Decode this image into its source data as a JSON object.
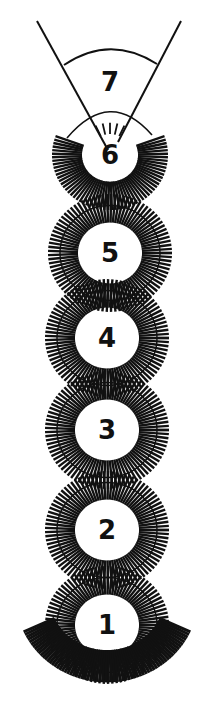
{
  "colors": {
    "ink": "#111111",
    "background": "#ffffff"
  },
  "segments": [
    {
      "label": "7",
      "cx": 110,
      "cy": 82,
      "type": "cone"
    },
    {
      "label": "6",
      "cx": 110,
      "cy": 155,
      "type": "partial"
    },
    {
      "label": "5",
      "cx": 110,
      "cy": 253,
      "type": "ring"
    },
    {
      "label": "4",
      "cx": 107,
      "cy": 338,
      "type": "ring"
    },
    {
      "label": "3",
      "cx": 107,
      "cy": 430,
      "type": "ring"
    },
    {
      "label": "2",
      "cx": 107,
      "cy": 530,
      "type": "ring"
    },
    {
      "label": "1",
      "cx": 107,
      "cy": 625,
      "type": "base"
    }
  ]
}
